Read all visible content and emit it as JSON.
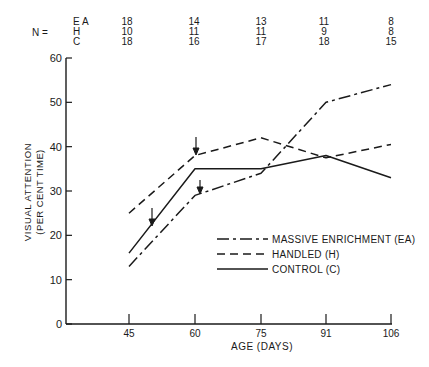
{
  "chart_data": {
    "type": "line",
    "title": "",
    "xlabel": "AGE (DAYS)",
    "ylabel": "VISUAL ATTENTION",
    "ylabel_sub": "(PER CENT TIME)",
    "x": [
      45,
      60,
      75,
      91,
      106
    ],
    "x_tick_labels": [
      "45",
      "60",
      "75",
      "91",
      "106"
    ],
    "y_ticks": [
      0,
      10,
      20,
      30,
      40,
      50,
      60
    ],
    "y_tick_labels": [
      "0",
      "10",
      "20",
      "30",
      "40",
      "50",
      "60"
    ],
    "ylim": [
      0,
      60
    ],
    "grid": false,
    "legend_position": "lower-right inside plot",
    "series": [
      {
        "name": "MASSIVE ENRICHMENT (EA)",
        "key": "EA",
        "style": "dash-dot",
        "values": [
          13,
          29,
          34,
          50,
          54
        ]
      },
      {
        "name": "HANDLED (H)",
        "key": "H",
        "style": "dashed",
        "values": [
          25,
          38,
          42,
          37.5,
          40.5
        ]
      },
      {
        "name": "CONTROL (C)",
        "key": "C",
        "style": "solid",
        "values": [
          16,
          35,
          35,
          38,
          33
        ]
      }
    ],
    "sample_sizes": {
      "label": "N =",
      "rows": [
        {
          "group": "E A",
          "values": [
            "18",
            "14",
            "13",
            "11",
            "8"
          ]
        },
        {
          "group": "H",
          "values": [
            "10",
            "11",
            "11",
            "9",
            "8"
          ]
        },
        {
          "group": "C",
          "values": [
            "18",
            "16",
            "17",
            "18",
            "15"
          ]
        }
      ]
    },
    "annotations": [
      {
        "type": "arrow",
        "target": "HANDLED (H)",
        "x": 60,
        "note": "down arrow above H at day 60"
      },
      {
        "type": "arrow",
        "target": "MASSIVE ENRICHMENT (EA)",
        "x": 60,
        "note": "down arrow above EA at day 60"
      },
      {
        "type": "arrow",
        "target": "CONTROL (C)",
        "x": 50,
        "note": "down arrow on C line between days 45 and 60"
      }
    ]
  },
  "colors": {
    "ink": "#1a1a1a",
    "background": "#ffffff"
  }
}
